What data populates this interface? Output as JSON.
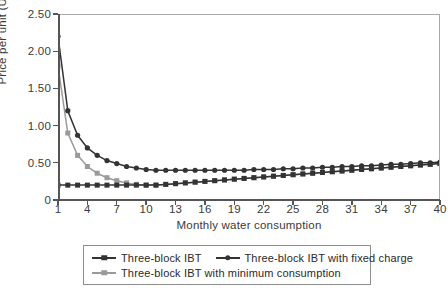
{
  "chart_data": {
    "type": "line",
    "title": "",
    "xlabel": "Monthly water consumption",
    "ylabel": "Price per unit (US$)",
    "xlim": [
      1,
      40
    ],
    "ylim": [
      0,
      2.5
    ],
    "grid": false,
    "legend_position": "bottom",
    "xticks": [
      1,
      4,
      7,
      10,
      13,
      16,
      19,
      22,
      25,
      28,
      31,
      34,
      37,
      40
    ],
    "xtick_labels": [
      "1",
      "4",
      "7",
      "10",
      "13",
      "16",
      "19",
      "22",
      "25",
      "28",
      "31",
      "34",
      "37",
      "40"
    ],
    "yticks": [
      0,
      0.5,
      1.0,
      1.5,
      2.0,
      2.5
    ],
    "ytick_labels": [
      "0",
      "0.50",
      "1.00",
      "1.50",
      "2.00",
      "2.50"
    ],
    "x": [
      1,
      2,
      3,
      4,
      5,
      6,
      7,
      8,
      9,
      10,
      11,
      12,
      13,
      14,
      15,
      16,
      17,
      18,
      19,
      20,
      21,
      22,
      23,
      24,
      25,
      26,
      27,
      28,
      29,
      30,
      31,
      32,
      33,
      34,
      35,
      36,
      37,
      38,
      39,
      40
    ],
    "series": [
      {
        "name": "Three-block IBT",
        "marker": "square",
        "color": "#333333",
        "values": [
          0.2,
          0.2,
          0.2,
          0.2,
          0.2,
          0.2,
          0.2,
          0.2,
          0.2,
          0.2,
          0.2,
          0.21,
          0.22,
          0.23,
          0.24,
          0.25,
          0.26,
          0.27,
          0.28,
          0.29,
          0.3,
          0.31,
          0.32,
          0.33,
          0.34,
          0.35,
          0.36,
          0.37,
          0.38,
          0.39,
          0.4,
          0.41,
          0.42,
          0.43,
          0.44,
          0.45,
          0.46,
          0.47,
          0.48,
          0.49
        ]
      },
      {
        "name": "Three-block IBT with fixed charge",
        "marker": "circle",
        "color": "#333333",
        "values": [
          2.2,
          1.2,
          0.87,
          0.7,
          0.6,
          0.53,
          0.49,
          0.45,
          0.43,
          0.41,
          0.4,
          0.4,
          0.4,
          0.4,
          0.4,
          0.4,
          0.4,
          0.4,
          0.4,
          0.4,
          0.41,
          0.41,
          0.41,
          0.42,
          0.42,
          0.43,
          0.43,
          0.44,
          0.44,
          0.45,
          0.45,
          0.46,
          0.46,
          0.47,
          0.48,
          0.48,
          0.49,
          0.5,
          0.5,
          0.51
        ]
      },
      {
        "name": "Three-block IBT with minimum consumption",
        "marker": "square",
        "color": "#9a9a9a",
        "values": [
          1.8,
          0.9,
          0.6,
          0.45,
          0.36,
          0.3,
          0.26,
          0.23,
          0.21,
          0.2,
          0.2,
          0.21,
          0.22,
          0.23,
          0.24,
          0.25,
          0.26,
          0.27,
          0.28,
          0.29,
          0.3,
          0.31,
          0.32,
          0.33,
          0.34,
          0.35,
          0.36,
          0.37,
          0.38,
          0.39,
          0.4,
          0.41,
          0.42,
          0.43,
          0.44,
          0.45,
          0.46,
          0.47,
          0.48,
          0.49
        ]
      }
    ]
  },
  "legend": {
    "entries": [
      {
        "label": "Three-block IBT"
      },
      {
        "label": "Three-block IBT with fixed charge"
      },
      {
        "label": "Three-block IBT with minimum consumption"
      }
    ]
  }
}
